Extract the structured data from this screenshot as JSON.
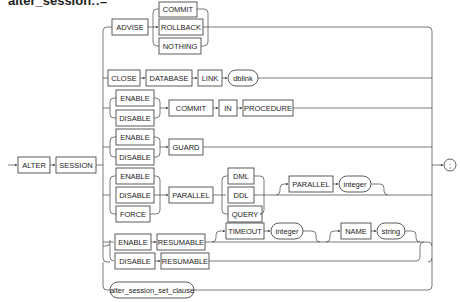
{
  "title": "alter_session::=",
  "diagram": {
    "start": {
      "keywords": [
        "ALTER",
        "SESSION"
      ]
    },
    "terminator": ";",
    "branches": [
      {
        "name": "advise",
        "items": [
          "ADVISE"
        ],
        "choices": [
          "COMMIT",
          "ROLLBACK",
          "NOTHING"
        ]
      },
      {
        "name": "close-database-link",
        "items": [
          "CLOSE",
          "DATABASE",
          "LINK"
        ],
        "param": "dblink"
      },
      {
        "name": "commit-in-procedure",
        "choices": [
          "ENABLE",
          "DISABLE"
        ],
        "items": [
          "COMMIT",
          "IN",
          "PROCEDURE"
        ]
      },
      {
        "name": "guard",
        "choices": [
          "ENABLE",
          "DISABLE"
        ],
        "items": [
          "GUARD"
        ]
      },
      {
        "name": "parallel",
        "choices": [
          "ENABLE",
          "DISABLE",
          "FORCE"
        ],
        "items": [
          "PARALLEL"
        ],
        "targets": [
          "DML",
          "DDL",
          "QUERY"
        ],
        "optional": {
          "keyword": "PARALLEL",
          "param": "integer"
        }
      },
      {
        "name": "enable-resumable",
        "items": [
          "ENABLE",
          "RESUMABLE"
        ],
        "optional_timeout": {
          "keyword": "TIMEOUT",
          "param": "integer"
        },
        "optional_name": {
          "keyword": "NAME",
          "param": "string"
        }
      },
      {
        "name": "disable-resumable",
        "items": [
          "DISABLE",
          "RESUMABLE"
        ]
      },
      {
        "name": "set-clause",
        "param": "alter_session_set_clause"
      }
    ]
  },
  "labels": {
    "alter": "ALTER",
    "session": "SESSION",
    "advise": "ADVISE",
    "commit": "COMMIT",
    "rollback": "ROLLBACK",
    "nothing": "NOTHING",
    "close": "CLOSE",
    "database": "DATABASE",
    "link": "LINK",
    "dblink": "dblink",
    "enable": "ENABLE",
    "disable": "DISABLE",
    "in": "IN",
    "procedure": "PROCEDURE",
    "guard": "GUARD",
    "force": "FORCE",
    "parallel": "PARALLEL",
    "dml": "DML",
    "ddl": "DDL",
    "query": "QUERY",
    "integer": "integer",
    "resumable": "RESUMABLE",
    "timeout": "TIMEOUT",
    "name": "NAME",
    "string": "string",
    "set_clause": "alter_session_set_clause",
    "semicolon": ";"
  }
}
